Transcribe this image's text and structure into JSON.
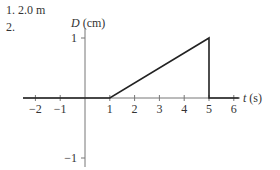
{
  "answers": [
    {
      "num": "1.",
      "text": "2.0 m"
    },
    {
      "num": "2.",
      "text": ""
    }
  ],
  "chart_data": {
    "type": "line",
    "title": "",
    "xlabel": "t (s)",
    "ylabel": "D (cm)",
    "x": [
      -2.5,
      1,
      5,
      5,
      6.2
    ],
    "y": [
      0,
      0,
      1,
      0,
      0
    ],
    "series": [
      {
        "name": "D(t)",
        "points": [
          [
            -2.5,
            0
          ],
          [
            1,
            0
          ],
          [
            5,
            1
          ],
          [
            5,
            0
          ],
          [
            6.2,
            0
          ]
        ]
      }
    ],
    "xticks": [
      -2,
      -1,
      1,
      2,
      3,
      4,
      5,
      6
    ],
    "xtick_labels": [
      "−2",
      "−1",
      "1",
      "2",
      "3",
      "4",
      "5",
      "6"
    ],
    "yticks": [
      1,
      -1
    ],
    "ytick_labels": [
      "1",
      "−1"
    ],
    "xlim": [
      -2.5,
      6.3
    ],
    "ylim": [
      -1.15,
      1.3
    ],
    "grid": false,
    "legend": "none"
  }
}
